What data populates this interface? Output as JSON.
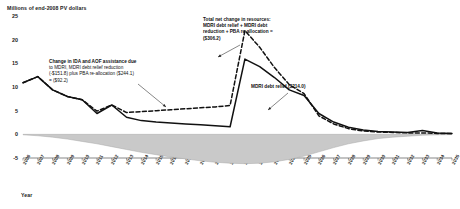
{
  "chart_data": {
    "type": "line",
    "title": "Millions of end-2008 PV dollars",
    "xlabel": "Year",
    "ylabel": "Millions of end-2008 PV dollars",
    "ylim": [
      -5,
      25
    ],
    "yticks": [
      25,
      20,
      15,
      10,
      5,
      0,
      -5
    ],
    "grid": false,
    "legend_position": "none",
    "categories": [
      "2006",
      "2007",
      "2008",
      "2009",
      "2010",
      "2011",
      "2012",
      "2013",
      "2014",
      "2015",
      "2016",
      "2017",
      "2018",
      "2019",
      "2020",
      "2021",
      "2022",
      "2023",
      "2024",
      "2025",
      "2026",
      "2027",
      "2028",
      "2029",
      "2030",
      "2031",
      "2032",
      "2033",
      "2034",
      "2035"
    ],
    "series": [
      {
        "name": "MDRI debt relief",
        "style": "solid",
        "color": "#111111",
        "values": [
          10.9,
          12.2,
          9.4,
          8.0,
          7.3,
          4.4,
          6.2,
          3.6,
          2.9,
          2.6,
          2.4,
          2.2,
          2.0,
          1.8,
          1.6,
          15.9,
          14.3,
          12.0,
          9.4,
          8.2,
          4.4,
          2.6,
          1.5,
          0.9,
          0.6,
          0.5,
          0.4,
          0.8,
          0.3,
          0.2
        ]
      },
      {
        "name": "Total net change in resources",
        "style": "dashed",
        "color": "#111111",
        "values": [
          10.9,
          12.2,
          9.4,
          8.0,
          7.3,
          4.9,
          6.2,
          4.6,
          4.8,
          5.0,
          5.2,
          5.4,
          5.6,
          5.8,
          6.1,
          21.9,
          18.4,
          14.1,
          10.5,
          8.6,
          3.9,
          2.2,
          1.2,
          0.7,
          0.5,
          0.4,
          0.3,
          0.3,
          0.2,
          0.2
        ]
      },
      {
        "name": "Change in IDA and AOF assistance",
        "style": "area",
        "color": "#c9c9c9",
        "values": [
          -0.1,
          -0.3,
          -0.6,
          -1.0,
          -1.5,
          -2.0,
          -2.6,
          -3.2,
          -3.8,
          -4.3,
          -4.8,
          -5.2,
          -5.6,
          -5.9,
          -6.1,
          -6.2,
          -6.1,
          -5.8,
          -5.3,
          -4.6,
          -3.7,
          -2.8,
          -2.0,
          -1.4,
          -0.9,
          -0.6,
          -0.4,
          -0.2,
          -0.1,
          -0.05
        ]
      }
    ],
    "annotations": [
      {
        "id": "ida",
        "lines": [
          "Change in IDA and AOF assistance due",
          "to MDRI, MDRI debt relief reduction",
          "(-$151.8) plus PBA re-allocation ($244.1)",
          "= ($92.2)"
        ],
        "bold_lines": [
          0
        ]
      },
      {
        "id": "total",
        "lines": [
          "Total net change in resources:",
          "MDRI debt relief + MDRI debt",
          "reduction + PBA re-allocation =",
          "($306.2)"
        ],
        "bold_lines": [
          0,
          1,
          2,
          3
        ]
      },
      {
        "id": "mdri",
        "lines": [
          "MDRI debt relief  ($214.0)"
        ],
        "bold_lines": [
          0
        ]
      }
    ]
  }
}
